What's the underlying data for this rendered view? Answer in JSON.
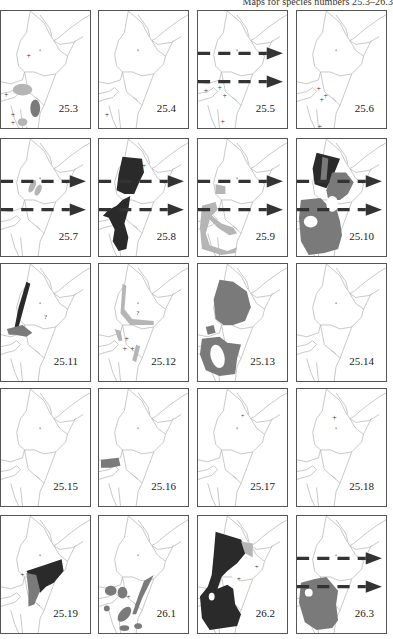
{
  "header": {
    "text": "Maps for species numbers 25.3–26.3"
  },
  "colors": {
    "border": "#555555",
    "outline": "#b0b0b0",
    "light": "#b5b5b5",
    "medium": "#7a7a7a",
    "dark": "#2a2a2a"
  },
  "panels": [
    {
      "label": "25.3",
      "arrows": false,
      "fill": "mixed"
    },
    {
      "label": "25.4",
      "arrows": false,
      "fill": "none"
    },
    {
      "label": "25.5",
      "arrows": true,
      "fill": "none"
    },
    {
      "label": "25.6",
      "arrows": false,
      "fill": "none"
    },
    {
      "label": "25.7",
      "arrows": true,
      "fill": "light"
    },
    {
      "label": "25.8",
      "arrows": true,
      "fill": "dark"
    },
    {
      "label": "25.9",
      "arrows": true,
      "fill": "light"
    },
    {
      "label": "25.10",
      "arrows": true,
      "fill": "mixed"
    },
    {
      "label": "25.11",
      "arrows": false,
      "fill": "mixed"
    },
    {
      "label": "25.12",
      "arrows": false,
      "fill": "light"
    },
    {
      "label": "25.13",
      "arrows": false,
      "fill": "medium"
    },
    {
      "label": "25.14",
      "arrows": false,
      "fill": "medium"
    },
    {
      "label": "25.15",
      "arrows": false,
      "fill": "none"
    },
    {
      "label": "25.16",
      "arrows": false,
      "fill": "none"
    },
    {
      "label": "25.17",
      "arrows": false,
      "fill": "mixed"
    },
    {
      "label": "25.18",
      "arrows": false,
      "fill": "medium"
    },
    {
      "label": "25.19",
      "arrows": false,
      "fill": "mixed"
    },
    {
      "label": "26.1",
      "arrows": false,
      "fill": "none"
    },
    {
      "label": "26.2",
      "arrows": false,
      "fill": "none"
    },
    {
      "label": "26.3",
      "arrows": true,
      "fill": "medium"
    }
  ]
}
